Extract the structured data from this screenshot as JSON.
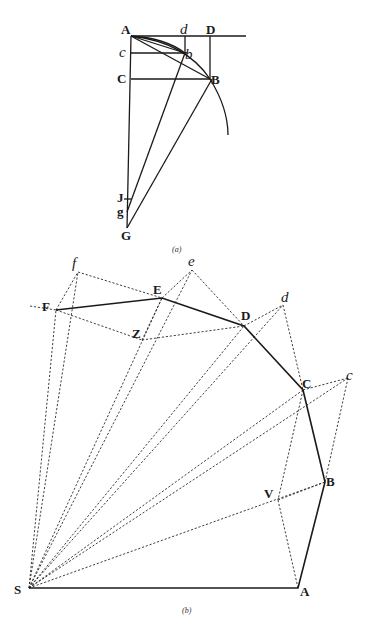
{
  "figure_a": {
    "caption": "(a)",
    "labels": {
      "A": "A",
      "d": "d",
      "D": "D",
      "c": "c",
      "b": "b",
      "C": "C",
      "B": "B",
      "J": "J",
      "g": "g",
      "G": "G"
    },
    "points": {
      "A": [
        131,
        36
      ],
      "d": [
        185,
        36
      ],
      "D": [
        210,
        36
      ],
      "c": [
        131,
        53
      ],
      "b": [
        185,
        53
      ],
      "C": [
        131,
        79
      ],
      "B": [
        210,
        79
      ],
      "J": [
        127,
        200
      ],
      "g": [
        127,
        210
      ],
      "G": [
        127,
        227
      ]
    }
  },
  "figure_b": {
    "caption": "(b)",
    "labels": {
      "S": "S",
      "A": "A",
      "B": "B",
      "C": "C",
      "D": "D",
      "E": "E",
      "F": "F",
      "c": "c",
      "d": "d",
      "e": "e",
      "f": "f",
      "V": "V",
      "Z": "Z"
    },
    "points": {
      "S": [
        29,
        588
      ],
      "A": [
        298,
        588
      ],
      "B": [
        325,
        482
      ],
      "C": [
        303,
        390
      ],
      "D": [
        244,
        326
      ],
      "E": [
        162,
        298
      ],
      "F": [
        56,
        310
      ],
      "c": [
        348,
        378
      ],
      "d": [
        283,
        305
      ],
      "e": [
        192,
        270
      ],
      "f": [
        78,
        272
      ],
      "V": [
        278,
        500
      ],
      "Z": [
        142,
        340
      ]
    },
    "polygon_order": [
      "S",
      "A",
      "B",
      "C",
      "D",
      "E",
      "F"
    ]
  }
}
